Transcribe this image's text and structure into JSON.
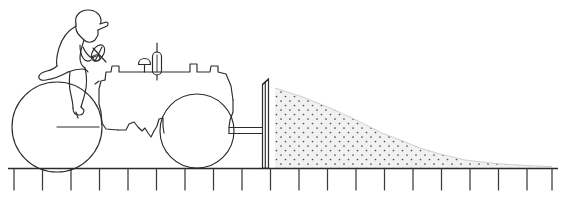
{
  "figure": {
    "background_color": "#ffffff",
    "line_color": "#2b2b2b",
    "width": 565,
    "height": 199
  },
  "parts": {
    "rider": "rider-figure",
    "rider_cap": "rider-cap",
    "steering_wheel": "steering-wheel",
    "exhaust_stack": "exhaust-stack",
    "air_filter": "air-filter-cap",
    "hood": "tractor-hood",
    "front_wheel": "front-wheel",
    "rear_wheel": "rear-wheel",
    "linkage_arm": "linkage-arm",
    "blade": "scraper-blade",
    "soil_pile": "soil-pile",
    "ground": "ground-line"
  },
  "geometry": {
    "ground_y": 168,
    "ground_x_start": 8,
    "ground_x_end": 558,
    "tick_count": 20,
    "tick_spacing": 28.5,
    "tick_length": 22,
    "front_wheel": {
      "cx": 57,
      "cy": 127,
      "r": 45
    },
    "rear_wheel": {
      "cx": 197,
      "cy": 131,
      "r": 37
    },
    "blade": {
      "x": 268,
      "top_y": 79,
      "bottom_y": 168,
      "thickness": 7
    },
    "pile": {
      "x_start": 275,
      "x_end": 552,
      "peak_y": 92
    }
  },
  "stipple": {
    "dot_color": "#4a4a4a",
    "fill_color": "#f1f1f1",
    "dot_radius": 0.85,
    "spacing_x": 9,
    "spacing_y": 9
  },
  "labels": {
    "figure_caption": ""
  }
}
